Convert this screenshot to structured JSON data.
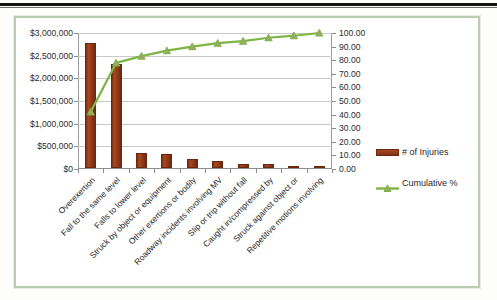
{
  "page": {
    "rule_name": "page-top-rule"
  },
  "chart_data": {
    "type": "bar",
    "title": "",
    "xlabel": "",
    "ylabel": "",
    "categories": [
      "Overexertion",
      "Fall to the same level",
      "Falls to lower level",
      "Struck by object or equipment",
      "Other exertions or bodily",
      "Roadway incidents involving MV",
      "Slip or trip without fall",
      "Caught in/compressed by",
      "Struck against object or",
      "Repetitive motions involving"
    ],
    "series": [
      {
        "name": "# of Injuries",
        "type": "bar",
        "axis": "left",
        "color": "#8e3a17",
        "values": [
          2750000,
          2300000,
          340000,
          300000,
          190000,
          150000,
          95000,
          90000,
          45000,
          45000
        ]
      },
      {
        "name": "Cumulative %",
        "type": "line",
        "axis": "right",
        "color": "#7db544",
        "marker": "triangle",
        "values": [
          42.0,
          78.0,
          83.0,
          87.0,
          90.0,
          92.5,
          94.0,
          96.5,
          98.0,
          100.0
        ]
      }
    ],
    "y_left": {
      "min": 0,
      "max": 3000000,
      "step": 500000,
      "ticks": [
        "$0",
        "$500,000",
        "$1,000,000",
        "$1,500,000",
        "$2,000,000",
        "$2,500,000",
        "$3,000,000"
      ]
    },
    "y_right": {
      "min": 0,
      "max": 100,
      "step": 10,
      "ticks": [
        "0.00",
        "10.00",
        "20.00",
        "30.00",
        "40.00",
        "50.00",
        "60.00",
        "70.00",
        "80.00",
        "90.00",
        "100.00"
      ]
    },
    "grid": true,
    "legend_position": "right",
    "legend": [
      "# of Injuries",
      "Cumulative %"
    ]
  }
}
